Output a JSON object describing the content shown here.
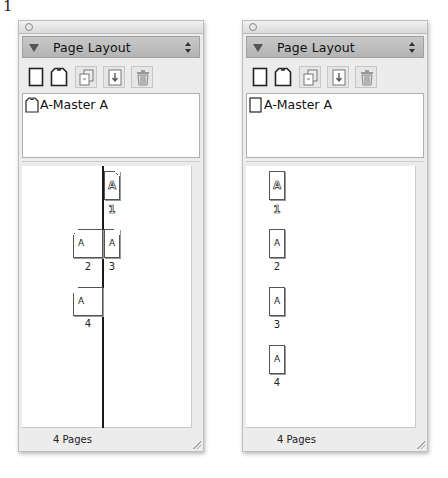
{
  "figure_label": "1",
  "panels": [
    {
      "id": "facing",
      "title": "Page Layout",
      "toolbar": [
        {
          "name": "single-page-icon",
          "boxed": false
        },
        {
          "name": "master-page-icon",
          "boxed": false
        },
        {
          "name": "duplicate-page-icon",
          "boxed": true
        },
        {
          "name": "insert-page-icon",
          "boxed": true
        },
        {
          "name": "trash-icon",
          "boxed": true
        }
      ],
      "master": {
        "label": "A-Master A",
        "icon": "facing-master-icon"
      },
      "pages": [
        {
          "num": "1",
          "master": "A",
          "current": true
        },
        {
          "num": "2",
          "master": "A",
          "current": false
        },
        {
          "num": "3",
          "master": "A",
          "current": false
        },
        {
          "num": "4",
          "master": "A",
          "current": false
        }
      ],
      "footer": "4 Pages"
    },
    {
      "id": "single",
      "title": "Page Layout",
      "toolbar": [
        {
          "name": "single-page-icon",
          "boxed": false
        },
        {
          "name": "master-page-icon",
          "boxed": false
        },
        {
          "name": "duplicate-page-icon",
          "boxed": true
        },
        {
          "name": "insert-page-icon",
          "boxed": true
        },
        {
          "name": "trash-icon",
          "boxed": true
        }
      ],
      "master": {
        "label": "A-Master A",
        "icon": "single-master-icon"
      },
      "pages": [
        {
          "num": "1",
          "master": "A",
          "current": true
        },
        {
          "num": "2",
          "master": "A",
          "current": false
        },
        {
          "num": "3",
          "master": "A",
          "current": false
        },
        {
          "num": "4",
          "master": "A",
          "current": false
        }
      ],
      "footer": "4 Pages"
    }
  ]
}
